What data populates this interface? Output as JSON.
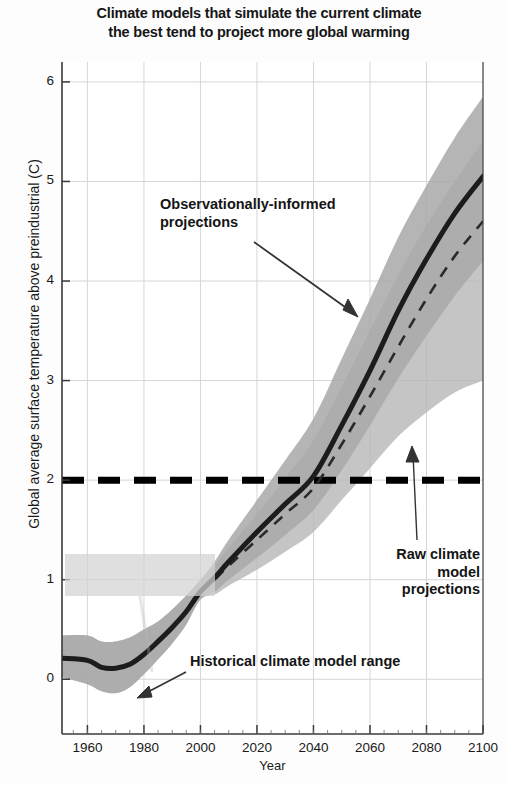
{
  "chart_data": {
    "type": "line",
    "title": "Climate models that simulate the current climate the best tend to project more global warming",
    "title_line1": "Climate models that simulate the current climate",
    "title_line2": "the best tend to project more global warming",
    "xlabel": "Year",
    "ylabel": "Global average surface temperature above preindustrial (C)",
    "xlim": [
      1951,
      2100
    ],
    "ylim": [
      -0.55,
      6.2
    ],
    "xticks": [
      1960,
      1980,
      2000,
      2020,
      2040,
      2060,
      2080,
      2100
    ],
    "xtick_labels": [
      "1960",
      "1980",
      "2000",
      "2020",
      "2040",
      "2060",
      "2080",
      "2100"
    ],
    "yticks": [
      0,
      1,
      2,
      3,
      4,
      5,
      6
    ],
    "ytick_labels": [
      "0",
      "1",
      "2",
      "3",
      "4",
      "5",
      "6"
    ],
    "grid": true,
    "legend": "none",
    "x": [
      1951,
      1960,
      1965,
      1970,
      1975,
      1980,
      1985,
      1990,
      1995,
      2000,
      2005,
      2010,
      2020,
      2030,
      2040,
      2050,
      2060,
      2070,
      2080,
      2090,
      2100
    ],
    "series": [
      {
        "name": "Observationally-informed projections (central estimate)",
        "style": "solid-thick-dark",
        "color": "#1c1c1c",
        "values": [
          0.21,
          0.19,
          0.12,
          0.11,
          0.15,
          0.25,
          0.38,
          0.52,
          0.68,
          0.88,
          1.02,
          1.18,
          1.48,
          1.76,
          2.04,
          2.55,
          3.1,
          3.7,
          4.22,
          4.68,
          5.05
        ]
      },
      {
        "name": "Raw climate model projections (central estimate)",
        "style": "dashed-dark",
        "color": "#2a2a2a",
        "values": [
          null,
          null,
          null,
          null,
          null,
          null,
          null,
          null,
          null,
          0.88,
          1.0,
          1.14,
          1.4,
          1.66,
          1.92,
          2.36,
          2.84,
          3.34,
          3.82,
          4.25,
          4.6
        ]
      }
    ],
    "bands": [
      {
        "name": "Observationally-informed projection range",
        "color": "#a8a8a8",
        "opacity": 0.85,
        "lower": [
          0.02,
          -0.05,
          -0.12,
          -0.14,
          -0.08,
          0.05,
          0.2,
          0.36,
          0.55,
          0.8,
          0.88,
          1.0,
          1.22,
          1.45,
          1.7,
          2.1,
          2.55,
          3.02,
          3.45,
          3.85,
          4.2
        ],
        "upper": [
          0.44,
          0.44,
          0.38,
          0.38,
          0.42,
          0.5,
          0.58,
          0.7,
          0.84,
          1.0,
          1.18,
          1.4,
          1.8,
          2.2,
          2.62,
          3.22,
          3.82,
          4.44,
          4.96,
          5.44,
          5.85
        ]
      },
      {
        "name": "Raw climate model projection range",
        "color": "#b6b6b6",
        "opacity": 0.8,
        "lower": [
          0.02,
          -0.05,
          -0.12,
          -0.14,
          -0.08,
          0.05,
          0.2,
          0.36,
          0.55,
          0.8,
          0.85,
          0.94,
          1.1,
          1.28,
          1.48,
          1.8,
          2.12,
          2.44,
          2.68,
          2.88,
          3.0
        ],
        "upper": [
          0.44,
          0.44,
          0.38,
          0.38,
          0.42,
          0.5,
          0.58,
          0.7,
          0.84,
          1.0,
          1.14,
          1.32,
          1.66,
          2.02,
          2.4,
          2.94,
          3.5,
          4.06,
          4.56,
          5.0,
          5.4
        ]
      }
    ],
    "threshold_line": {
      "name": "2 C threshold",
      "value": 2.0,
      "style": "dashed-thick-black",
      "color": "#000000"
    },
    "annotations": [
      {
        "id": "observationally-informed",
        "text": "Observationally-informed projections",
        "line1": "Observationally-informed",
        "line2": "projections",
        "arrow": "down-right"
      },
      {
        "id": "raw-climate-model",
        "text": "Raw climate model projections",
        "line1": "Raw climate",
        "line2": "model",
        "line3": "projections",
        "arrow": "up"
      },
      {
        "id": "historical-range",
        "text": "Historical climate model range",
        "arrow": "down-left"
      }
    ]
  }
}
